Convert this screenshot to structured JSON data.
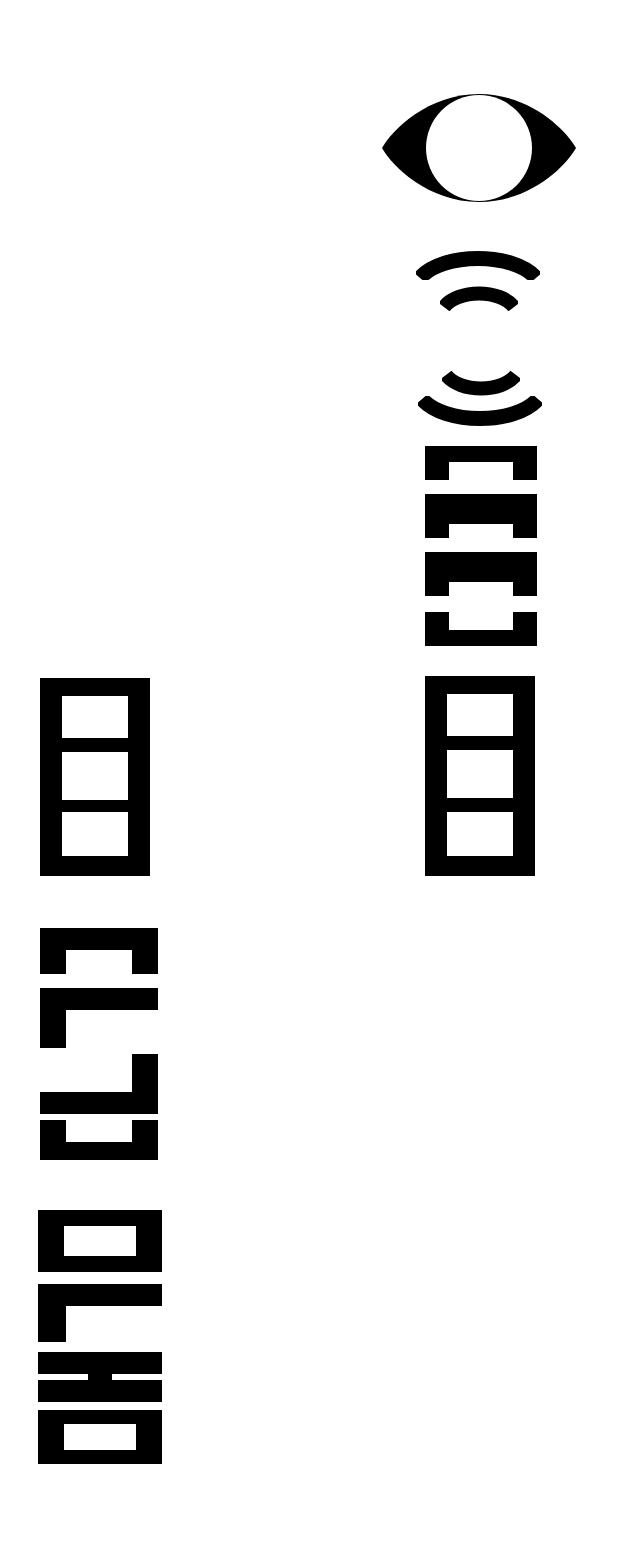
{
  "page": {
    "title": "OLHO",
    "background_color": "#ffffff",
    "ink_color": "#000000",
    "description": "Typographic poster: an eye pictogram above concentric sound-wave arcs, with the word OLHO set in heavy rotated block letters."
  },
  "symbols": {
    "eye": {
      "name": "eye-pictogram",
      "label": "eye",
      "sclera_color": "#000000",
      "iris_color": "#ffffff"
    },
    "arcs": {
      "name": "wave-arcs",
      "label": "sound waves",
      "count": 4,
      "items": [
        {
          "label": "upper outer arc",
          "direction": "up",
          "size": "large"
        },
        {
          "label": "upper inner arc",
          "direction": "up",
          "size": "small"
        },
        {
          "label": "lower inner arc",
          "direction": "down",
          "size": "small"
        },
        {
          "label": "lower outer arc",
          "direction": "down",
          "size": "large"
        }
      ]
    }
  },
  "columns": {
    "right": {
      "name": "right-text-column",
      "rotation": "90deg counter-clockwise",
      "groups": [
        {
          "label": "[III]",
          "type": "brackets",
          "reading": "[III]"
        },
        {
          "label": "目",
          "type": "block",
          "reading": "block with three windows"
        }
      ]
    },
    "left": {
      "name": "left-text-column",
      "rotation": "90deg counter-clockwise",
      "groups": [
        {
          "label": "目",
          "type": "block",
          "reading": "block with three windows"
        },
        {
          "label": "[C]",
          "type": "brackets",
          "reading": "bracket forms"
        },
        {
          "label": "OLHO",
          "type": "word",
          "reading": "OLHO"
        }
      ]
    }
  },
  "word": {
    "text": "OLHO",
    "letters": [
      "O",
      "L",
      "H",
      "O"
    ],
    "language": "Portuguese",
    "meaning": "eye"
  }
}
